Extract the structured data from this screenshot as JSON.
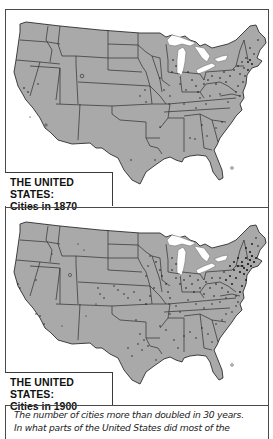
{
  "colors": {
    "land": "#a9a9a9",
    "border": "#2e2e2e",
    "lakes": "#ffffff",
    "dots": "#111111",
    "frame": "#4a4a4a"
  },
  "maps": [
    {
      "title": "THE UNITED STATES:",
      "subtitle": "Cities in 1870",
      "year": "1870",
      "density": "sparse, concentrated in Northeast and Midwest"
    },
    {
      "title": "THE UNITED STATES:",
      "subtitle": "Cities in 1900",
      "year": "1900",
      "density": "dense in Northeast and Midwest, spreading west and south"
    }
  ],
  "caption": {
    "line1": "The number of cities more than doubled in 30 years.",
    "line2": "In what parts of the United States did most of the"
  }
}
